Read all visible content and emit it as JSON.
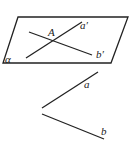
{
  "figure": {
    "plane": {
      "label": "α",
      "points": [
        [
          18,
          17
        ],
        [
          128,
          17
        ],
        [
          111,
          63
        ],
        [
          3,
          63
        ]
      ]
    },
    "lines_in_plane": [
      {
        "label": "a′",
        "from": [
          26,
          58
        ],
        "to": [
          82,
          22
        ]
      },
      {
        "label": "b′",
        "from": [
          29,
          32
        ],
        "to": [
          92,
          55
        ]
      }
    ],
    "intersection_point": {
      "label": "A"
    },
    "lines_outside": [
      {
        "label": "a",
        "from": [
          42,
          108
        ],
        "to": [
          98,
          72
        ]
      },
      {
        "label": "b",
        "from": [
          42,
          114
        ],
        "to": [
          104,
          139
        ]
      }
    ],
    "colors": {
      "stroke": "#222222",
      "background": "#ffffff"
    }
  }
}
